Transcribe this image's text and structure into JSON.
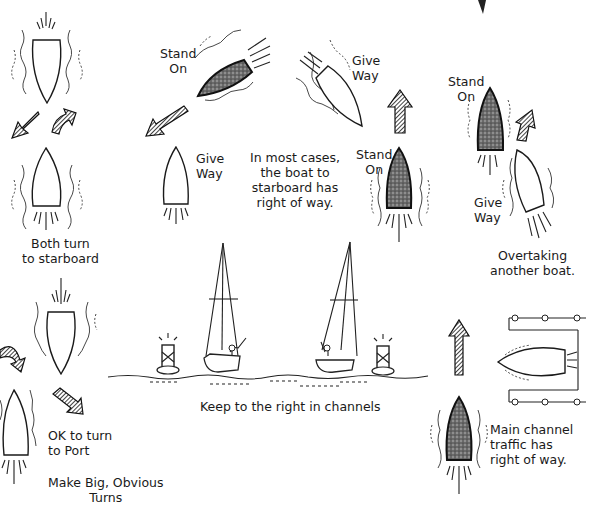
{
  "diagram": {
    "colors": {
      "ink": "#1a1a1a",
      "background": "#ffffff",
      "stand_on_fill": "#555555"
    },
    "panels": {
      "head_on": {
        "caption": [
          "Both turn",
          "to starboard"
        ],
        "boats": [
          {
            "role": "oncoming",
            "heading": "down"
          },
          {
            "role": "own",
            "heading": "up"
          }
        ],
        "arrows": [
          "turn-right-arrow",
          "turn-right-arrow"
        ]
      },
      "crossing": {
        "caption": [
          "In most cases,",
          "the boat to",
          "starboard has",
          "right of way."
        ],
        "labels": {
          "stand_on_top": [
            "Stand",
            "On"
          ],
          "give_way_top": [
            "Give",
            "Way"
          ],
          "give_way_left": [
            "Give",
            "Way"
          ],
          "stand_on_right": [
            "Stand",
            "On"
          ]
        }
      },
      "overtaking": {
        "caption": [
          "Overtaking",
          "another boat."
        ],
        "labels": {
          "stand_on": [
            "Stand",
            "On"
          ],
          "give_way": [
            "Give",
            "Way"
          ]
        }
      },
      "port_turn": {
        "caption_main": [
          "OK to turn",
          "to Port"
        ],
        "caption_sub": [
          "Make Big, Obvious",
          "Turns"
        ]
      },
      "channel": {
        "caption": "Keep to the right in channels"
      },
      "main_channel": {
        "caption": [
          "Main channel",
          "traffic has",
          "right of way."
        ]
      }
    }
  }
}
